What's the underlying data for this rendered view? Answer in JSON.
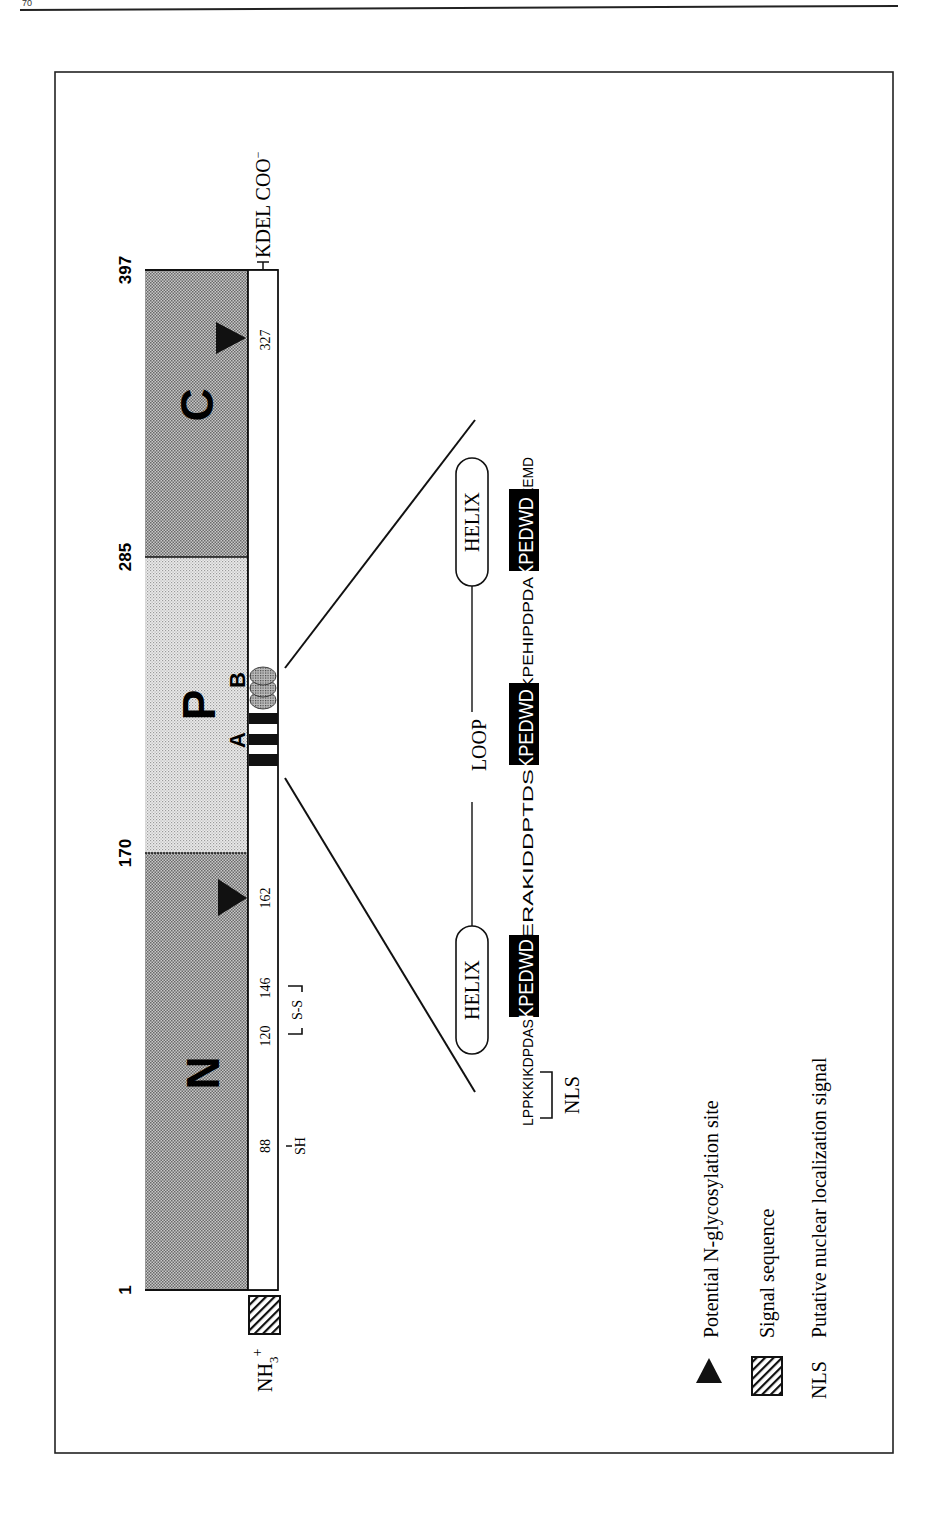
{
  "page": {
    "page_number": "70"
  },
  "diagram": {
    "orientation": "rotated-90-ccw",
    "positions": {
      "start": "1",
      "n_p_boundary": "170",
      "p_c_boundary": "285",
      "end": "397"
    },
    "domains": [
      {
        "id": "N",
        "label": "N",
        "start": 1,
        "end": 170,
        "shade": "dark"
      },
      {
        "id": "P",
        "label": "P",
        "start": 170,
        "end": 285,
        "shade": "light"
      },
      {
        "id": "C",
        "label": "C",
        "start": 285,
        "end": 397,
        "shade": "dark"
      }
    ],
    "repeat_labels": {
      "a": "A",
      "b": "B"
    },
    "residue_labels": {
      "r88": "88",
      "r120": "120",
      "r146": "146",
      "r162": "162",
      "r327": "327"
    },
    "features": {
      "sh": "SH",
      "disulfide": "S-S",
      "n_terminus": "NH3+",
      "n_terminus_main": "NH",
      "n_terminus_sub": "3",
      "n_terminus_sup": "+",
      "c_terminus": "KDEL COO−",
      "c_terminus_main": "KDEL COO",
      "c_terminus_sup": "−"
    },
    "expansion": {
      "helix1": "HELIX",
      "loop": "LOOP",
      "helix2": "HELIX",
      "nls_label": "NLS",
      "sequence": [
        {
          "text": "LPPKKIKDPDAS",
          "highlight": false
        },
        {
          "text": "KPEDWD",
          "highlight": true
        },
        {
          "text": "ERAKIDDPTDS",
          "highlight": false
        },
        {
          "text": "KPEDWD",
          "highlight": true
        },
        {
          "text": "KPEHIPDPDA",
          "highlight": false
        },
        {
          "text": "KPEDWD",
          "highlight": true
        },
        {
          "text": "EEMD",
          "highlight": false
        }
      ]
    },
    "legend": [
      {
        "icon": "triangle-icon",
        "label": "Potential N-glycosylation site"
      },
      {
        "icon": "hatched-box-icon",
        "label": "Signal sequence"
      },
      {
        "icon": "nls-abbrev",
        "abbrev": "NLS",
        "label": "Putative nuclear localization signal"
      }
    ]
  },
  "colors": {
    "dark_domain": "#b4b4b4",
    "light_domain": "#dcdcdc",
    "ink": "#111111",
    "paper": "#ffffff"
  }
}
